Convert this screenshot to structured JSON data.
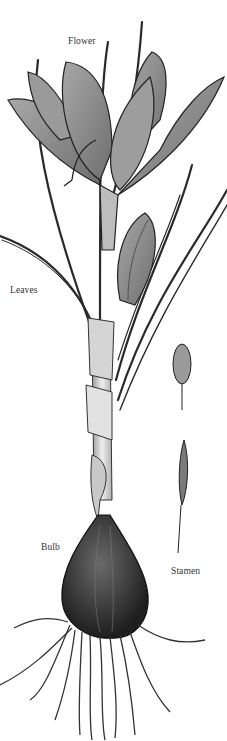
{
  "labels": {
    "flower": "Flower",
    "leaves": "Leaves",
    "bulb": "Bulb",
    "stamen": "Stamen"
  },
  "colors": {
    "ink": "#1a1a1a",
    "petal_fill": "#8a8a8a",
    "petal_light": "#b5b5b5",
    "stem_fill": "#dcdcdc",
    "bulb_fill": "#3a3a3a",
    "background": "#ffffff"
  }
}
